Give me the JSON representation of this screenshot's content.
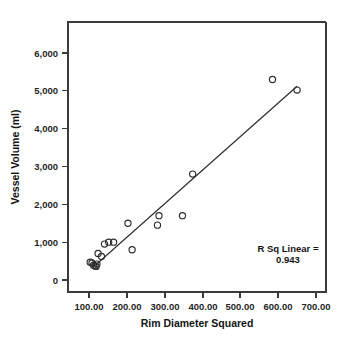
{
  "chart_data": {
    "type": "scatter",
    "title": "",
    "xlabel": "Rim Diameter Squared",
    "ylabel": "Vessel Volume (ml)",
    "xlim": [
      60,
      720
    ],
    "ylim": [
      -400,
      6300
    ],
    "grid": false,
    "legend": null,
    "xticks": [
      100,
      200,
      300,
      400,
      500,
      600,
      700
    ],
    "xtick_labels": [
      "100.00",
      "200.00",
      "300.00",
      "400.00",
      "500.00",
      "600.00",
      "700.00"
    ],
    "yticks": [
      0,
      1000,
      2000,
      3000,
      4000,
      5000,
      6000
    ],
    "ytick_labels": [
      "0",
      "1,000",
      "2,000",
      "3,000",
      "4,000",
      "5,000",
      "6,000"
    ],
    "points": [
      {
        "x": 103,
        "y": 470
      },
      {
        "x": 108,
        "y": 450
      },
      {
        "x": 112,
        "y": 390
      },
      {
        "x": 116,
        "y": 370
      },
      {
        "x": 119,
        "y": 360
      },
      {
        "x": 121,
        "y": 420
      },
      {
        "x": 124,
        "y": 700
      },
      {
        "x": 133,
        "y": 620
      },
      {
        "x": 141,
        "y": 950
      },
      {
        "x": 152,
        "y": 1000
      },
      {
        "x": 165,
        "y": 1000
      },
      {
        "x": 203,
        "y": 1500
      },
      {
        "x": 214,
        "y": 800
      },
      {
        "x": 281,
        "y": 1450
      },
      {
        "x": 285,
        "y": 1700
      },
      {
        "x": 347,
        "y": 1700
      },
      {
        "x": 374,
        "y": 2800
      },
      {
        "x": 585,
        "y": 5300
      },
      {
        "x": 650,
        "y": 5020
      }
    ],
    "fit_line": {
      "x_start": 110,
      "y_start": 330,
      "x_end": 650,
      "y_end": 5120
    },
    "annotation": {
      "line1": "R Sq Linear =",
      "line2": "0.943"
    }
  }
}
